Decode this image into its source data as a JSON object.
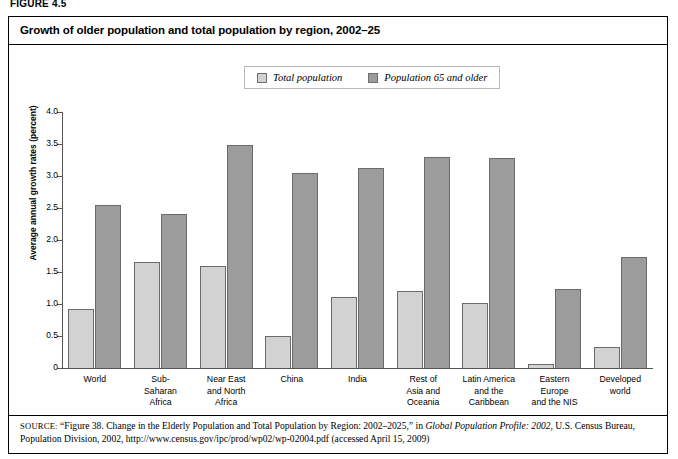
{
  "figure": {
    "label": "FIGURE 4.5",
    "title": "Growth of older population and total population by region, 2002–25"
  },
  "legend": {
    "items": [
      {
        "label": "Total population",
        "color": "#d2d2d2",
        "icon": "square-swatch-icon"
      },
      {
        "label": "Population 65 and older",
        "color": "#9c9c9c",
        "icon": "square-swatch-icon"
      }
    ]
  },
  "source": {
    "prefix": "SOURCE:",
    "text_1": "“Figure 38. Change in the Elderly Population and Total Population by Region: 2002–2025,” in ",
    "italic_title": "Global Population Profile: 2002",
    "text_2": ", U.S. Census Bureau, Population Division, 2002, http://www.census.gov/ipc/prod/wp02/wp-02004.pdf (accessed April 15, 2009)"
  },
  "chart_data": {
    "type": "bar",
    "title": "Growth of older population and total population by region, 2002–25",
    "xlabel": "",
    "ylabel": "Average annual growth rates (percent)",
    "ylim": [
      0,
      4.0
    ],
    "yticks": [
      "0",
      "0.5",
      "1.0",
      "1.5",
      "2.0",
      "2.5",
      "3.0",
      "3.5",
      "4.0"
    ],
    "ytick_values": [
      0,
      0.5,
      1.0,
      1.5,
      2.0,
      2.5,
      3.0,
      3.5,
      4.0
    ],
    "grid": false,
    "legend_position": "top-center",
    "categories": [
      "World",
      "Sub-Saharan Africa",
      "Near East and North Africa",
      "China",
      "India",
      "Rest of Asia and Oceania",
      "Latin America and the Caribbean",
      "Eastern Europe and the NIS",
      "Developed world"
    ],
    "category_lines": [
      [
        "World"
      ],
      [
        "Sub-",
        "Saharan",
        "Africa"
      ],
      [
        "Near East",
        "and North",
        "Africa"
      ],
      [
        "China"
      ],
      [
        "India"
      ],
      [
        "Rest of",
        "Asia and",
        "Oceania"
      ],
      [
        "Latin America",
        "and the",
        "Caribbean"
      ],
      [
        "Eastern",
        "Europe",
        "and the NIS"
      ],
      [
        "Developed",
        "world"
      ]
    ],
    "series": [
      {
        "name": "Total population",
        "color": "#d2d2d2",
        "values": [
          0.92,
          1.65,
          1.59,
          0.5,
          1.11,
          1.2,
          1.01,
          0.06,
          0.33
        ]
      },
      {
        "name": "Population 65 and older",
        "color": "#9c9c9c",
        "values": [
          2.55,
          2.41,
          3.49,
          3.05,
          3.13,
          3.3,
          3.28,
          1.23,
          1.73
        ]
      }
    ]
  }
}
